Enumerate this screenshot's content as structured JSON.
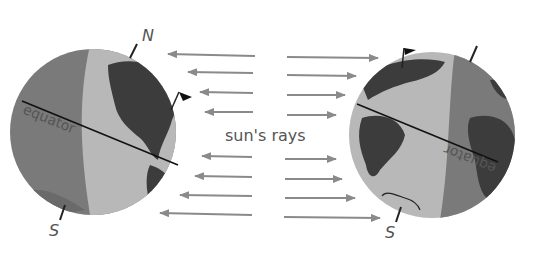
{
  "diagram": {
    "center_label": "sun's rays",
    "left_globe": {
      "north_label": "N",
      "south_label": "S",
      "equator_label": "equator"
    },
    "right_globe": {
      "south_label": "S",
      "equator_label": "equator"
    },
    "colors": {
      "night": "#7a7a7a",
      "day": "#b8b8b8",
      "land": "#3c3c3c",
      "arrow": "#8a8a8a",
      "text": "#555555"
    }
  }
}
